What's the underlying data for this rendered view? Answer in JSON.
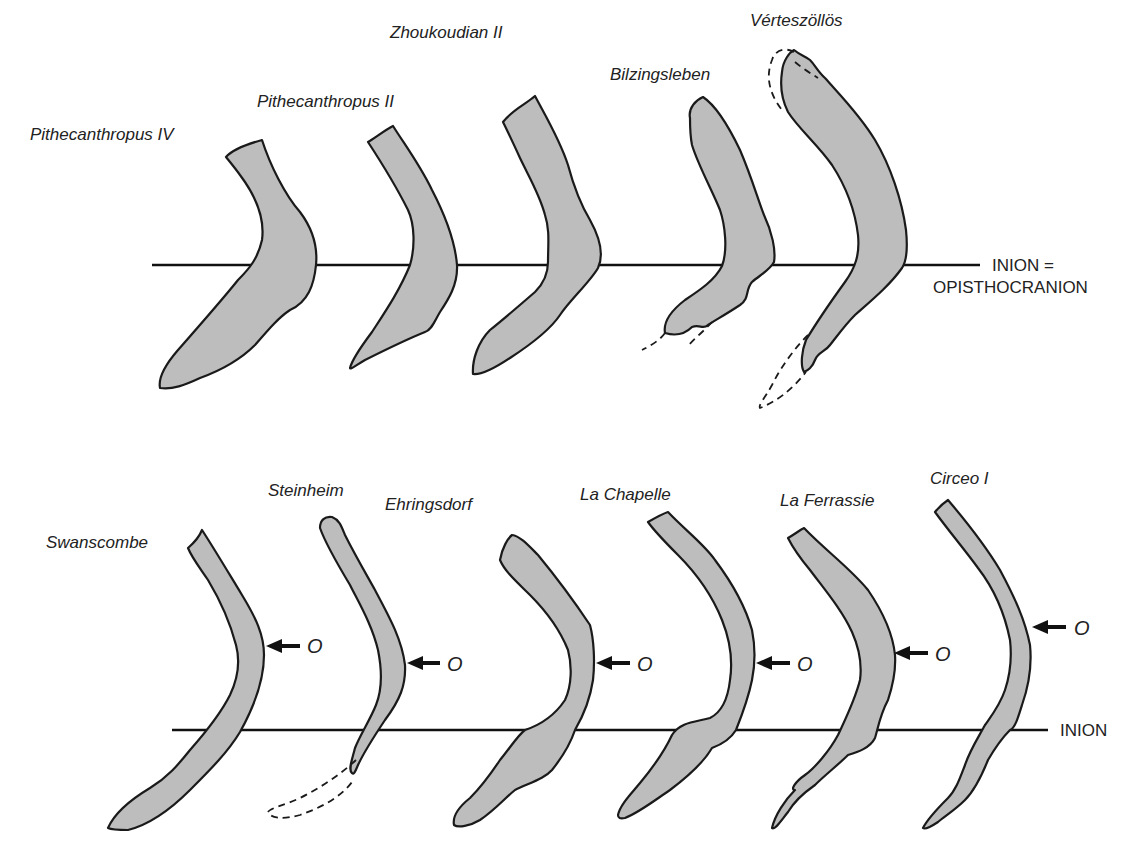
{
  "figure": {
    "top_row": {
      "reference_line_label_1": "INION =",
      "reference_line_label_2": "OPISTHOCRANION",
      "specimens": [
        {
          "name": "Pithecanthropus IV"
        },
        {
          "name": "Pithecanthropus II"
        },
        {
          "name": "Zhoukoudian II"
        },
        {
          "name": "Bilzingsleben"
        },
        {
          "name": "Vérteszöllös"
        }
      ]
    },
    "bottom_row": {
      "reference_line_label": "INION",
      "opisthocranion_marker": "O",
      "specimens": [
        {
          "name": "Swanscombe"
        },
        {
          "name": "Steinheim"
        },
        {
          "name": "Ehringsdorf"
        },
        {
          "name": "La Chapelle"
        },
        {
          "name": "La Ferrassie"
        },
        {
          "name": "Circeo I"
        }
      ]
    },
    "colors": {
      "bone_fill": "#bdbdbd",
      "outline": "#1a1a1a",
      "background": "#ffffff"
    }
  }
}
